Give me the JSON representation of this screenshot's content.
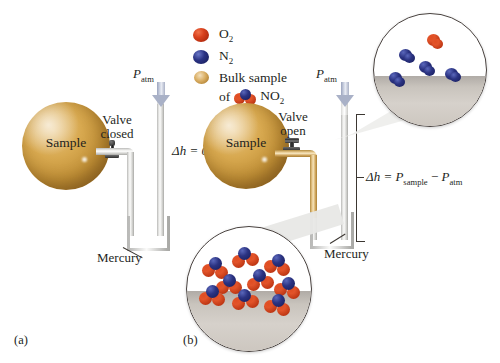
{
  "figure": {
    "panels": [
      {
        "id": "a",
        "label": "(a)"
      },
      {
        "id": "b",
        "label": "(b)"
      }
    ]
  },
  "legend": {
    "items": [
      {
        "key": "o2",
        "label": "O",
        "sub": "2",
        "icon": "red-sphere-icon",
        "color": "#d8401c"
      },
      {
        "key": "n2",
        "label": "N",
        "sub": "2",
        "icon": "blue-sphere-icon",
        "color": "#2b3384"
      },
      {
        "key": "bulk",
        "label_line1": "Bulk sample",
        "label_line2_pre": "of",
        "label_line2_post": "NO",
        "sub": "2",
        "icon": "tan-sphere-icon",
        "color": "#d9ad62"
      }
    ]
  },
  "panel_a": {
    "label": "(a)",
    "sphere_label": "Sample",
    "valve_label_line1": "Valve",
    "valve_label_line2": "closed",
    "pressure_arrow_label": "P",
    "pressure_arrow_sub": "atm",
    "delta_h_label": "Δh = 0",
    "mercury_label": "Mercury",
    "valve_state": "closed",
    "tube_gas": "none",
    "mercury_level_left": "equal",
    "mercury_level_right": "equal"
  },
  "panel_b": {
    "label": "(b)",
    "sphere_label": "Sample",
    "valve_label_line1": "Valve",
    "valve_label_line2": "open",
    "pressure_arrow_label": "P",
    "pressure_arrow_sub": "atm",
    "delta_h_label_lead": "Δh = ",
    "delta_h_p1": "P",
    "delta_h_p1_sub": "sample",
    "delta_h_minus": " − ",
    "delta_h_p2": "P",
    "delta_h_p2_sub": "atm",
    "mercury_label": "Mercury",
    "valve_state": "open",
    "tube_gas": "NO2",
    "mercury_level_left": "lower",
    "mercury_level_right": "higher"
  },
  "inset_top_right": {
    "name": "air-above-mercury-inset",
    "description": "Sparse air molecules above mercury surface",
    "molecule_count": 5,
    "molecules": [
      {
        "type": "N2",
        "x": 22,
        "y": 33
      },
      {
        "type": "O2",
        "x": 47,
        "y": 20
      },
      {
        "type": "N2",
        "x": 41,
        "y": 44
      },
      {
        "type": "N2",
        "x": 14,
        "y": 54
      },
      {
        "type": "N2",
        "x": 64,
        "y": 50
      }
    ],
    "mercury_fill_percent": 45
  },
  "inset_bottom_left": {
    "name": "no2-above-mercury-inset",
    "description": "Dense NO2 gas molecules above mercury surface",
    "molecule_count": 9,
    "molecules": [
      {
        "type": "NO2",
        "x": 16,
        "y": 28
      },
      {
        "type": "NO2",
        "x": 40,
        "y": 20
      },
      {
        "type": "NO2",
        "x": 64,
        "y": 26
      },
      {
        "type": "NO2",
        "x": 27,
        "y": 42
      },
      {
        "type": "NO2",
        "x": 52,
        "y": 38
      },
      {
        "type": "NO2",
        "x": 74,
        "y": 44
      },
      {
        "type": "NO2",
        "x": 14,
        "y": 52
      },
      {
        "type": "NO2",
        "x": 40,
        "y": 54
      },
      {
        "type": "NO2",
        "x": 66,
        "y": 58
      }
    ],
    "mercury_fill_percent": 48
  },
  "colors": {
    "oxygen": "#d8401c",
    "nitrogen": "#2b3384",
    "sample_gold": "#d7a84f",
    "mercury_gray": "#c9c4bd",
    "glass_gray": "#d3d3d0",
    "gas_amber": "#e3c183",
    "arrow_blue_gray": "#a9b1c7",
    "text": "#241f1c"
  }
}
